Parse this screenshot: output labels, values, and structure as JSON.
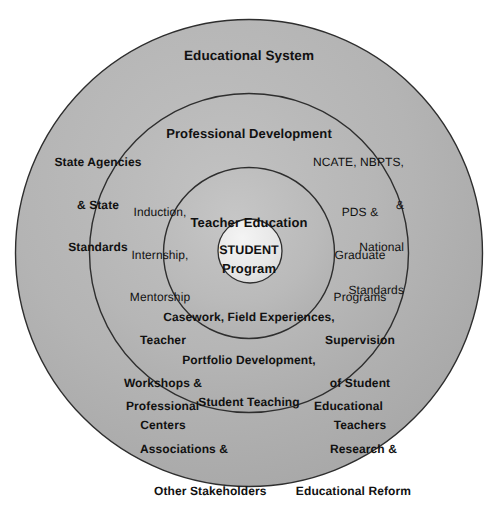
{
  "diagram": {
    "title": "Educational System",
    "type": "concentric-circles",
    "background_color": "#ffffff",
    "ring_fill_colors": [
      "#b0b0b0",
      "#b4b4b4",
      "#b8b8b8",
      "#e6e6e6"
    ],
    "stroke_color": "#2b2b2b",
    "text_color": "#111111",
    "center": {
      "x": 249,
      "y": 253
    },
    "rings": [
      {
        "name": "educational-system",
        "level": 1,
        "radius": 234,
        "heading": "Educational System",
        "labels": [
          "State Agencies\n& State\nStandards",
          "NCATE, NBPTS,\n&\nNational\nStandards",
          "Professional\nAssociations &\nOther Stakeholders",
          "Educational\nResearch &\nEducational Reform"
        ]
      },
      {
        "name": "professional-development",
        "level": 2,
        "radius": 160,
        "heading": "Professional Development",
        "labels": [
          "Induction,\nInternship,\nMentorship",
          "PDS &\nGraduate\nPrograms",
          "Teacher\nWorkshops &\nCenters",
          "Supervision\nof Student\nTeachers"
        ]
      },
      {
        "name": "teacher-education-program",
        "level": 3,
        "radius": 86,
        "heading": "Teacher Education\nProgram",
        "labels": [
          "Casework, Field Experiences,\nPortfolio Development,\nStudent Teaching"
        ]
      },
      {
        "name": "student",
        "level": 4,
        "radius": 32,
        "heading": "STUDENT",
        "labels": []
      }
    ]
  },
  "labels": {
    "educational_system": "Educational System",
    "professional_development": "Professional Development",
    "teacher_education_program_line1": "Teacher Education",
    "teacher_education_program_line2": "Program",
    "student": "STUDENT",
    "state_agencies_line1": "State Agencies",
    "state_agencies_line2": "& State",
    "state_agencies_line3": "Standards",
    "ncate_line1": "NCATE, NBPTS,",
    "ncate_line2": "&",
    "ncate_line3": "National",
    "ncate_line4": "Standards",
    "induction_line1": "Induction,",
    "induction_line2": "Internship,",
    "induction_line3": "Mentorship",
    "pds_line1": "PDS &",
    "pds_line2": "Graduate",
    "pds_line3": "Programs",
    "casework_line1": "Casework, Field Experiences,",
    "casework_line2": "Portfolio Development,",
    "casework_line3": "Student Teaching",
    "teacher_workshops_line1": "Teacher",
    "teacher_workshops_line2": "Workshops &",
    "teacher_workshops_line3": "Centers",
    "supervision_line1": "Supervision",
    "supervision_line2": "of Student",
    "supervision_line3": "Teachers",
    "professional_associations_line1": "Professional",
    "professional_associations_line2": "Associations &",
    "professional_associations_line3": "Other Stakeholders",
    "educational_research_line1": "Educational",
    "educational_research_line2": "Research &",
    "educational_research_line3": "Educational Reform"
  }
}
